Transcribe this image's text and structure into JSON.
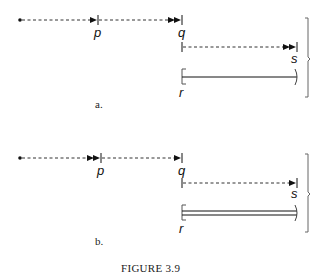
{
  "figure": {
    "caption": "FIGURE 3.9",
    "panels": [
      {
        "id": "a",
        "caption": "a.",
        "labels": {
          "p": "p",
          "q": "q",
          "s": "s",
          "r": "r"
        },
        "arrows": {
          "p": "single",
          "q": "double",
          "s": "double"
        },
        "r_line": "single"
      },
      {
        "id": "b",
        "caption": "b.",
        "labels": {
          "p": "p",
          "q": "q",
          "s": "s",
          "r": "r"
        },
        "arrows": {
          "p": "double",
          "q": "single",
          "s": "single"
        },
        "r_line": "double"
      }
    ]
  }
}
